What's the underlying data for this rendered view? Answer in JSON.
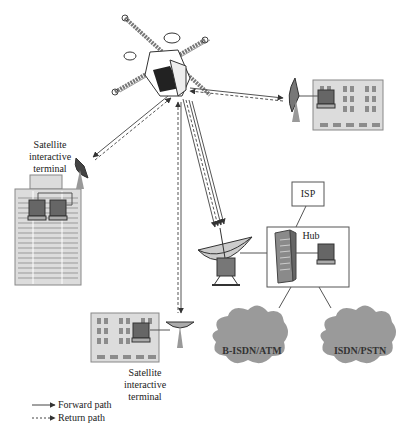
{
  "diagram": {
    "nodes": {
      "satellite": {
        "label": ""
      },
      "terminal_left": {
        "label_lines": [
          "Satellite",
          "interactive",
          "terminal"
        ]
      },
      "terminal_bottom": {
        "label_lines": [
          "Satellite",
          "interactive",
          "terminal"
        ]
      },
      "terminal_right": {
        "label": ""
      },
      "isp": {
        "label": "ISP"
      },
      "hub": {
        "label": "Hub"
      },
      "cloud_left": {
        "label": "B-ISDN/ATM"
      },
      "cloud_right": {
        "label": "ISDN/PSTN"
      }
    },
    "legend": {
      "forward": "Forward path",
      "return": "Return path"
    },
    "colors": {
      "building": "#d9d9d9",
      "window": "#8c8c8c",
      "cloud": "#9a9a9a",
      "line": "#444444"
    }
  }
}
